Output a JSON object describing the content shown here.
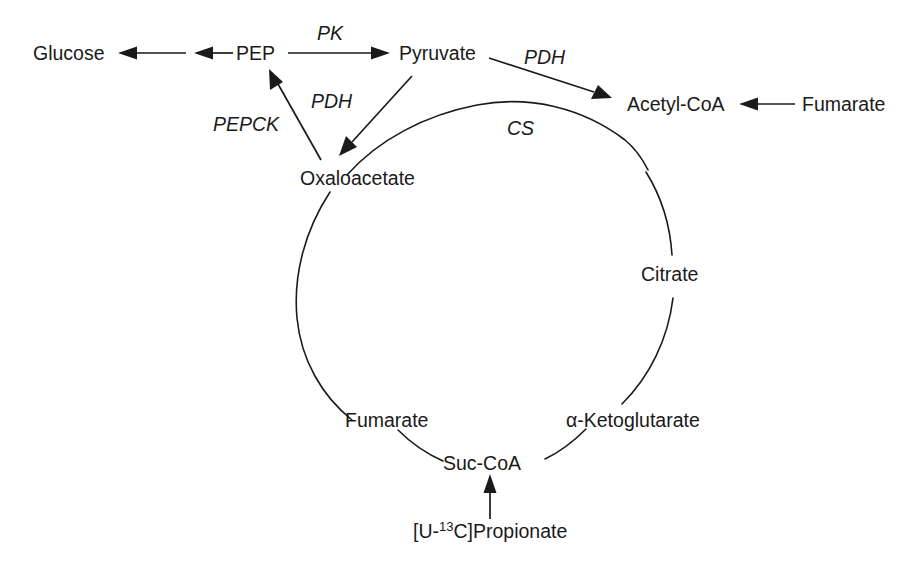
{
  "diagram": {
    "background_color": "#ffffff",
    "stroke_color": "#1a1a1a",
    "nodes": {
      "glucose": "Glucose",
      "pep": "PEP",
      "pyruvate": "Pyruvate",
      "acetyl_coa": "Acetyl-CoA",
      "fumarate_external": "Fumarate",
      "oxaloacetate": "Oxaloacetate",
      "citrate": "Citrate",
      "alpha_ketoglutarate": "α-Ketoglutarate",
      "fumarate_cycle": "Fumarate",
      "suc_coa": "Suc-CoA",
      "propionate_prefix": "[U-",
      "propionate_superscript": "13",
      "propionate_suffix": "C]Propionate"
    },
    "enzymes": {
      "pk": "PK",
      "pdh_top": "PDH",
      "pdh_left": "PDH",
      "pepck": "PEPCK",
      "cs": "CS"
    }
  }
}
